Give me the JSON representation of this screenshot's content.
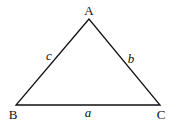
{
  "diagram": {
    "type": "triangle",
    "stroke_color": "#111111",
    "vertices": [
      {
        "label": "A",
        "x": 89,
        "y": 19
      },
      {
        "label": "B",
        "x": 16,
        "y": 105
      },
      {
        "label": "C",
        "x": 160,
        "y": 105
      }
    ],
    "sides": [
      {
        "label": "a",
        "between": "B-C"
      },
      {
        "label": "b",
        "between": "A-C"
      },
      {
        "label": "c",
        "between": "A-B"
      }
    ]
  }
}
